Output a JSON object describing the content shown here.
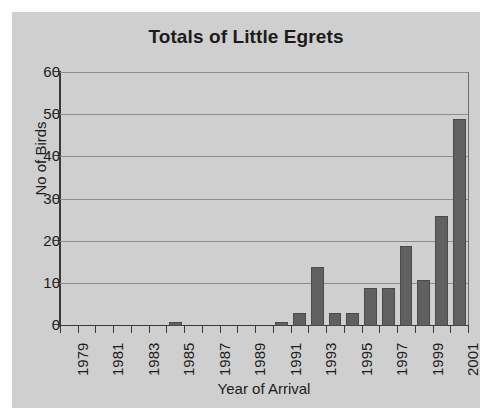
{
  "chart_data": {
    "type": "bar",
    "title": "Totals of Little Egrets",
    "xlabel": "Year of Arrival",
    "ylabel": "No of Birds",
    "ylim": [
      0,
      60
    ],
    "ytick_values": [
      0,
      10,
      20,
      30,
      40,
      50,
      60
    ],
    "ytick_labels": [
      "0",
      "10",
      "20",
      "30",
      "40",
      "50",
      "60"
    ],
    "grid": true,
    "legend": false,
    "bar_color": "#606060",
    "plot_background": "#cfcfcf",
    "categories": [
      "1979",
      "1980",
      "1981",
      "1982",
      "1983",
      "1984",
      "1985",
      "1986",
      "1987",
      "1988",
      "1989",
      "1990",
      "1991",
      "1992",
      "1993",
      "1994",
      "1995",
      "1996",
      "1997",
      "1998",
      "1999",
      "2000",
      "2001"
    ],
    "values": [
      0,
      0,
      0,
      0,
      0,
      0,
      1,
      0,
      0,
      0,
      0,
      0,
      1,
      3,
      14,
      3,
      3,
      9,
      9,
      19,
      11,
      26,
      49
    ],
    "xtick_labels": [
      "1979",
      "1981",
      "1983",
      "1985",
      "1987",
      "1989",
      "1991",
      "1993",
      "1995",
      "1997",
      "1999",
      "2001"
    ]
  }
}
